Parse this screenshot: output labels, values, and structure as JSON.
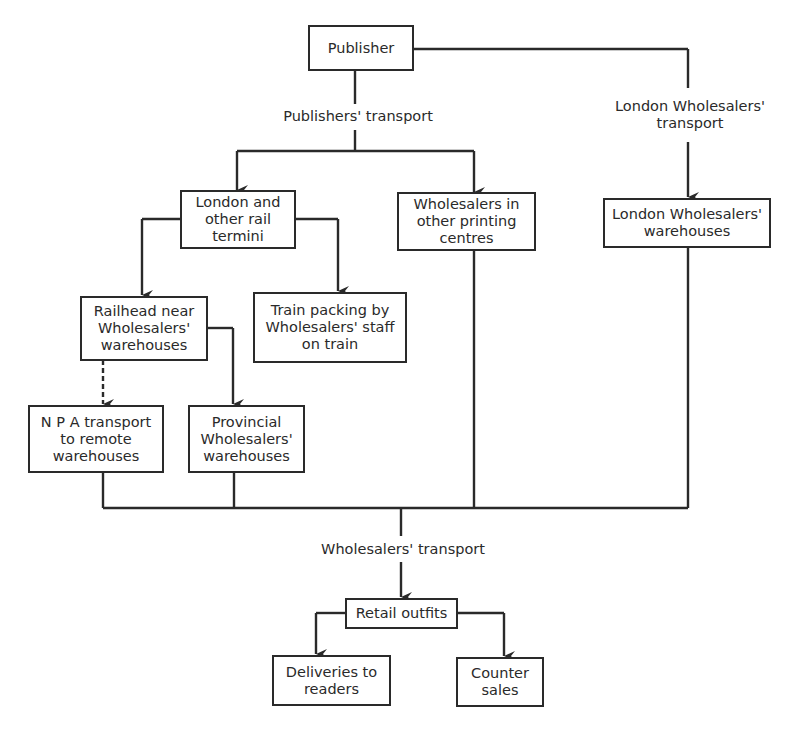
{
  "diagram": {
    "type": "flowchart",
    "nodes": {
      "publisher": "Publisher",
      "rail_termini": "London and\nother rail\ntermini",
      "printing_centres": "Wholesalers in\nother printing\ncentres",
      "london_warehouses": "London Wholesalers'\nwarehouses",
      "railhead": "Railhead near\nWholesalers'\nwarehouses",
      "train_packing": "Train packing by\nWholesalers' staff\non train",
      "npa_transport": "N P A transport\nto remote\nwarehouses",
      "provincial_warehouses": "Provincial\nWholesalers'\nwarehouses",
      "retail_outfits": "Retail outfits",
      "deliveries": "Deliveries to\nreaders",
      "counter_sales": "Counter\nsales"
    },
    "edge_labels": {
      "publishers_transport": "Publishers' transport",
      "london_wholesalers_transport": "London Wholesalers'\ntransport",
      "wholesalers_transport": "Wholesalers' transport"
    },
    "edges": [
      {
        "from": "publisher",
        "to": "rail_termini",
        "label": "Publishers' transport",
        "style": "solid"
      },
      {
        "from": "publisher",
        "to": "printing_centres",
        "label": "Publishers' transport",
        "style": "solid"
      },
      {
        "from": "publisher",
        "to": "london_warehouses",
        "label": "London Wholesalers' transport",
        "style": "solid"
      },
      {
        "from": "rail_termini",
        "to": "railhead",
        "style": "solid"
      },
      {
        "from": "rail_termini",
        "to": "train_packing",
        "style": "solid"
      },
      {
        "from": "railhead",
        "to": "npa_transport",
        "style": "dashed"
      },
      {
        "from": "railhead",
        "to": "provincial_warehouses",
        "style": "solid"
      },
      {
        "from": "npa_transport",
        "to": "retail_outfits",
        "label": "Wholesalers' transport",
        "style": "solid"
      },
      {
        "from": "provincial_warehouses",
        "to": "retail_outfits",
        "label": "Wholesalers' transport",
        "style": "solid"
      },
      {
        "from": "printing_centres",
        "to": "retail_outfits",
        "label": "Wholesalers' transport",
        "style": "solid"
      },
      {
        "from": "london_warehouses",
        "to": "retail_outfits",
        "label": "Wholesalers' transport",
        "style": "solid"
      },
      {
        "from": "retail_outfits",
        "to": "deliveries",
        "style": "solid"
      },
      {
        "from": "retail_outfits",
        "to": "counter_sales",
        "style": "solid"
      }
    ]
  }
}
